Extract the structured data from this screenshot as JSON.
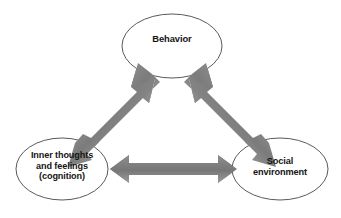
{
  "diagram": {
    "background_color": "#ffffff",
    "node_outline_color": "#5a5a5a",
    "node_fill_color": "#ffffff",
    "arrow_color": "#7d7d7d",
    "arrow_shade_dark": "#6e6e6e",
    "arrow_shade_light": "#969696",
    "text_color": "#141414",
    "nodes": [
      {
        "id": "behavior",
        "label": "Behavior",
        "position": "top-center",
        "cx": 172,
        "cy": 46,
        "rx": 50,
        "ry": 32
      },
      {
        "id": "cognition",
        "label": "Inner thoughts\nand feelings\n(cognition)",
        "position": "bottom-left",
        "cx": 62,
        "cy": 169,
        "rx": 46,
        "ry": 31
      },
      {
        "id": "social",
        "label": "Social\nenvironment",
        "position": "bottom-right",
        "cx": 280,
        "cy": 169,
        "rx": 48,
        "ry": 31
      }
    ],
    "connectors": [
      {
        "id": "behavior-cognition",
        "from": "behavior",
        "to": "cognition",
        "style": "double-headed-arrow",
        "orientation": "diagonal-left"
      },
      {
        "id": "behavior-social",
        "from": "behavior",
        "to": "social",
        "style": "double-headed-arrow",
        "orientation": "diagonal-right"
      },
      {
        "id": "cognition-social",
        "from": "cognition",
        "to": "social",
        "style": "double-headed-arrow",
        "orientation": "horizontal"
      }
    ]
  }
}
